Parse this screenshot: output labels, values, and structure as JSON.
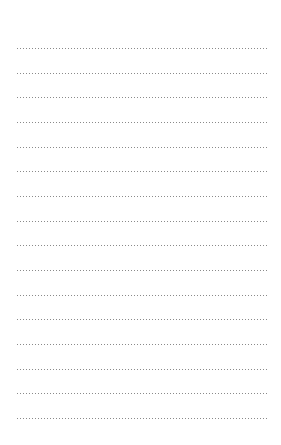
{
  "page": {
    "type": "dotted-lined-paper",
    "line_count": 16,
    "first_line_y": 48,
    "line_spacing": 24.67,
    "line_left": 16,
    "line_width": 253,
    "dot_color": "#8a8a8a",
    "background": "#ffffff"
  }
}
